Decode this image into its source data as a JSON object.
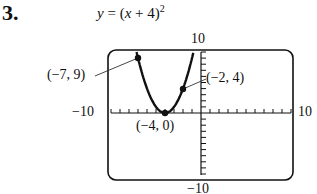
{
  "problem": {
    "number": "3.",
    "equation": {
      "lhs": "y",
      "eq": " = (",
      "var": "x",
      "rest": " + 4)",
      "exp": "2"
    }
  },
  "window": {
    "ymax_label": "10",
    "ymin_label": "−10",
    "xmin_label": "−10",
    "xmax_label": "10"
  },
  "points": [
    {
      "label": "(−7, 9)",
      "x": -7,
      "y": 9
    },
    {
      "label": "(−2, 4)",
      "x": -2,
      "y": 4
    },
    {
      "label": "(−4, 0)",
      "x": -4,
      "y": 0
    }
  ],
  "chart_data": {
    "type": "line",
    "xlabel": "",
    "ylabel": "",
    "xlim": [
      -10,
      10
    ],
    "ylim": [
      -10,
      10
    ],
    "xticks_step": 1,
    "yticks_step": 1,
    "grid": false,
    "series": [
      {
        "name": "y = (x + 4)^2",
        "x": [
          -7.16,
          -7,
          -6,
          -5,
          -4,
          -3,
          -2,
          -1,
          -0.84
        ],
        "y": [
          10,
          9,
          4,
          1,
          0,
          1,
          4,
          9,
          10
        ]
      }
    ],
    "annotations": [
      {
        "text": "(−7, 9)",
        "x": -7,
        "y": 9
      },
      {
        "text": "(−2, 4)",
        "x": -2,
        "y": 4
      },
      {
        "text": "(−4, 0)",
        "x": -4,
        "y": 0
      }
    ]
  }
}
